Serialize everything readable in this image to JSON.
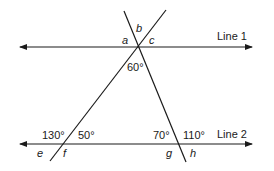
{
  "diagram": {
    "type": "parallel lines cut by transversals",
    "lines": [
      {
        "label": "Line 1"
      },
      {
        "label": "Line 2"
      }
    ],
    "angles": {
      "a": "a",
      "b": "b",
      "c": "c",
      "top_bottom": "60°",
      "e": "e",
      "f": "f",
      "g": "g",
      "h": "h",
      "left_upper_left": "130°",
      "left_upper_right": "50°",
      "right_upper_left": "70°",
      "right_upper_right": "110°"
    },
    "colors": {
      "stroke": "#1a1a1a",
      "background": "#ffffff"
    }
  }
}
